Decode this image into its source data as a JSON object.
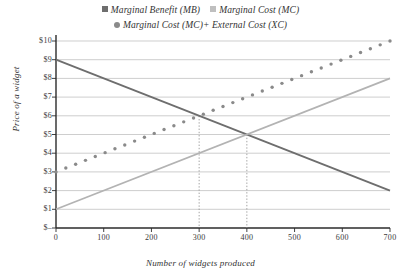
{
  "chart_data": {
    "type": "line",
    "title": "",
    "xlabel": "Number of widgets produced",
    "ylabel": "Price of a widget",
    "xlim": [
      0,
      700
    ],
    "ylim": [
      0,
      10
    ],
    "grid": true,
    "legend_position": "top",
    "x_ticks": [
      "0",
      "100",
      "200",
      "300",
      "400",
      "500",
      "600",
      "700"
    ],
    "x_tick_values": [
      0,
      100,
      200,
      300,
      400,
      500,
      600,
      700
    ],
    "y_ticks": [
      "$–",
      "$1",
      "$2",
      "$3",
      "$4",
      "$5",
      "$6",
      "$7",
      "$8",
      "$9",
      "$10"
    ],
    "y_tick_values": [
      0,
      1,
      2,
      3,
      4,
      5,
      6,
      7,
      8,
      9,
      10
    ],
    "series": [
      {
        "name": "Marginal Benefit (MB)",
        "style": "solid",
        "color": "#6e6e6e",
        "x": [
          0,
          700
        ],
        "values": [
          9,
          2
        ]
      },
      {
        "name": "Marginal Cost (MC)",
        "style": "solid",
        "color": "#b3b3b3",
        "x": [
          0,
          700
        ],
        "values": [
          1,
          8
        ]
      },
      {
        "name": "Marginal Cost (MC)+ External Cost (XC)",
        "style": "dotted",
        "color": "#8a8a8a",
        "x": [
          0,
          700
        ],
        "values": [
          3,
          10
        ]
      }
    ],
    "annotations": [
      {
        "name": "socially-optimal-quantity",
        "type": "vertical-guide",
        "x": 300,
        "y": 6,
        "style": "dotted"
      },
      {
        "name": "market-equilibrium-quantity",
        "type": "vertical-guide",
        "x": 400,
        "y": 5,
        "style": "dotted"
      }
    ]
  },
  "legend": {
    "row1": [
      {
        "label": "Marginal Benefit (MB)",
        "color": "#6e6e6e",
        "marker": "sq"
      },
      {
        "label": "Marginal Cost (MC)",
        "color": "#bfbfbf",
        "marker": "sq"
      }
    ],
    "row2": [
      {
        "label": "Marginal Cost (MC)+ External Cost (XC)",
        "color": "#8a8a8a",
        "marker": "dot"
      }
    ]
  },
  "colors": {
    "axis": "#2b2b2b",
    "grid": "#b9b9b9",
    "guide": "#9a9a9a",
    "mb": "#6e6e6e",
    "mc": "#b3b3b3",
    "mcxc": "#8a8a8a"
  }
}
